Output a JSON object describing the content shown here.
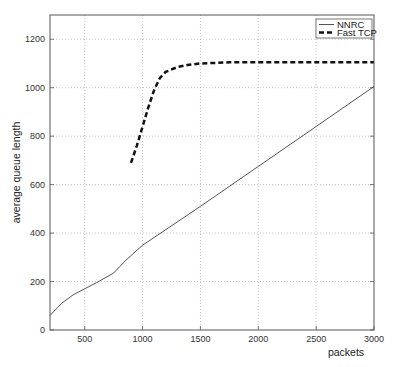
{
  "chart_data": {
    "type": "line",
    "title": "",
    "xlabel": "packets",
    "ylabel": "average queue length",
    "xlim": [
      200,
      3000
    ],
    "ylim": [
      0,
      1300
    ],
    "xticks": [
      500,
      1000,
      1500,
      2000,
      2500,
      3000
    ],
    "yticks": [
      0,
      200,
      400,
      600,
      800,
      1000,
      1200
    ],
    "grid": true,
    "legend_position": "upper right",
    "series": [
      {
        "name": "NNRC",
        "style": "solid",
        "x": [
          200,
          300,
          400,
          500,
          600,
          750,
          850,
          1000,
          1500,
          2000,
          2500,
          3000
        ],
        "y": [
          60,
          110,
          145,
          170,
          195,
          235,
          285,
          350,
          510,
          675,
          840,
          1005
        ]
      },
      {
        "name": "Fast TCP",
        "style": "dashed",
        "x": [
          900,
          950,
          1000,
          1050,
          1100,
          1150,
          1200,
          1300,
          1400,
          1500,
          1750,
          2000,
          2500,
          3000
        ],
        "y": [
          690,
          760,
          840,
          920,
          990,
          1040,
          1065,
          1085,
          1095,
          1100,
          1105,
          1105,
          1105,
          1105
        ]
      }
    ]
  }
}
